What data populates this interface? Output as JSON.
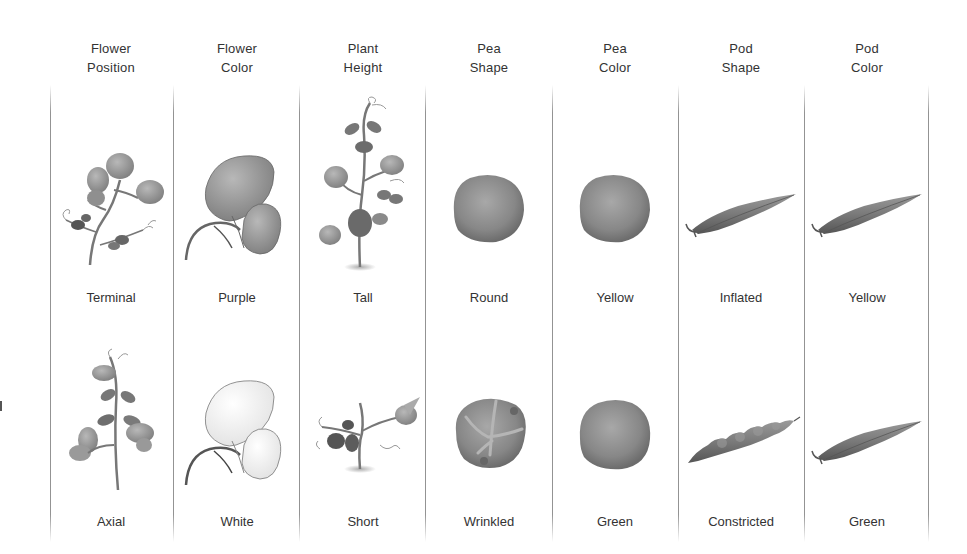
{
  "diagram": {
    "columns": [
      {
        "id": "flower-position",
        "header": [
          "Flower",
          "Position"
        ],
        "dominant": {
          "label": "Terminal",
          "illustration": "pea-plant-terminal-flowers"
        },
        "recessive": {
          "label": "Axial",
          "illustration": "pea-plant-axial-flowers"
        }
      },
      {
        "id": "flower-color",
        "header": [
          "Flower",
          "Color"
        ],
        "dominant": {
          "label": "Purple",
          "illustration": "purple-flower"
        },
        "recessive": {
          "label": "White",
          "illustration": "white-flower"
        }
      },
      {
        "id": "plant-height",
        "header": [
          "Plant",
          "Height"
        ],
        "dominant": {
          "label": "Tall",
          "illustration": "tall-pea-plant"
        },
        "recessive": {
          "label": "Short",
          "illustration": "short-pea-plant"
        }
      },
      {
        "id": "pea-shape",
        "header": [
          "Pea",
          "Shape"
        ],
        "dominant": {
          "label": "Round",
          "illustration": "round-pea"
        },
        "recessive": {
          "label": "Wrinkled",
          "illustration": "wrinkled-pea"
        }
      },
      {
        "id": "pea-color",
        "header": [
          "Pea",
          "Color"
        ],
        "dominant": {
          "label": "Yellow",
          "illustration": "yellow-pea"
        },
        "recessive": {
          "label": "Green",
          "illustration": "green-pea"
        }
      },
      {
        "id": "pod-shape",
        "header": [
          "Pod",
          "Shape"
        ],
        "dominant": {
          "label": "Inflated",
          "illustration": "inflated-pod"
        },
        "recessive": {
          "label": "Constricted",
          "illustration": "constricted-pod"
        }
      },
      {
        "id": "pod-color",
        "header": [
          "Pod",
          "Color"
        ],
        "dominant": {
          "label": "Yellow",
          "illustration": "yellow-pod"
        },
        "recessive": {
          "label": "Green",
          "illustration": "green-pod"
        }
      }
    ],
    "colors": {
      "text": "#333333",
      "divider": "#787878",
      "illustration_dark": "#5a5a5a",
      "illustration_mid": "#8a8a8a",
      "illustration_light": "#bdbdbd"
    }
  }
}
